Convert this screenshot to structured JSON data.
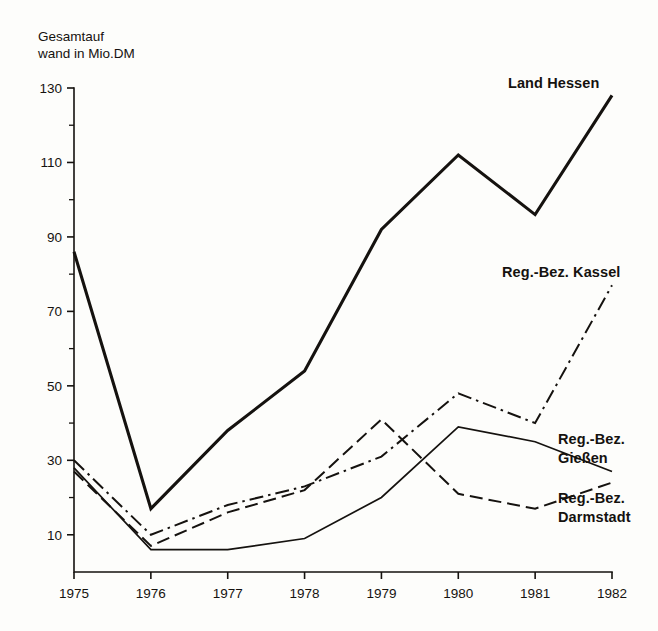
{
  "chart_data": {
    "type": "line",
    "title": "",
    "ylabel": "Gesamtauf-\nwand in Mio.DM",
    "ylabel_line1": "Gesamtauf­",
    "ylabel_line2": "wand in Mio.DM",
    "xlabel": "",
    "x": [
      1975,
      1976,
      1977,
      1978,
      1979,
      1980,
      1981,
      1982
    ],
    "xtick_labels": [
      "1975",
      "1976",
      "1977",
      "1978",
      "1979",
      "1980",
      "1981",
      "1982"
    ],
    "ytick_labels": [
      "130",
      "110",
      "90",
      "70",
      "50",
      "30",
      "10"
    ],
    "ytick_values": [
      130,
      110,
      90,
      70,
      50,
      30,
      10
    ],
    "yminor_values": [
      120,
      100,
      80,
      60,
      40,
      20
    ],
    "ylim": [
      0,
      130
    ],
    "xlim": [
      1975,
      1982
    ],
    "grid": false,
    "legend_position": "inline-right",
    "series": [
      {
        "name": "Land Hessen",
        "style": "solid-thick",
        "label_text": "Land Hessen",
        "values": [
          86,
          17,
          38,
          54,
          92,
          112,
          96,
          128
        ]
      },
      {
        "name": "Reg.-Bez. Kassel",
        "style": "dash-dot",
        "label_text": "Reg.-Bez. Kassel",
        "values": [
          30,
          10,
          18,
          23,
          31,
          48,
          40,
          77
        ]
      },
      {
        "name": "Reg.-Bez. Gießen",
        "style": "solid-thin",
        "label_text_line1": "Reg.-Bez.",
        "label_text_line2": "Gießen",
        "values": [
          28,
          6,
          6,
          9,
          20,
          39,
          35,
          27
        ]
      },
      {
        "name": "Reg.-Bez. Darmstadt",
        "style": "dashed",
        "label_text_line1": "Reg.-Bez.",
        "label_text_line2": "Darmstadt",
        "values": [
          27,
          7,
          16,
          22,
          41,
          21,
          17,
          24
        ]
      }
    ]
  },
  "colors": {
    "ink": "#15120f",
    "paper": "#fdfdfb"
  }
}
